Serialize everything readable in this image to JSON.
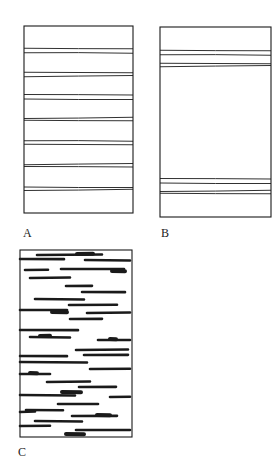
{
  "colors": {
    "ink": "#1a1a1a",
    "background": "#ffffff"
  },
  "panels": [
    {
      "id": "A",
      "label": "A",
      "description": "rectangle with seven evenly spaced pairs of thin horizontal lines",
      "rect": {
        "x": 24,
        "y": 26,
        "w": 109,
        "h": 187
      },
      "label_pos": {
        "x": 23,
        "y": 227
      },
      "lines_y": [
        49,
        53,
        72,
        76,
        95,
        99,
        118,
        121,
        141,
        144,
        164,
        167,
        187,
        190
      ]
    },
    {
      "id": "B",
      "label": "B",
      "description": "rectangle with two groups of four thin horizontal lines near top and bottom",
      "rect": {
        "x": 160,
        "y": 27,
        "w": 111,
        "h": 190
      },
      "label_pos": {
        "x": 161,
        "y": 227
      },
      "lines_y": [
        51,
        55,
        63,
        66,
        179,
        183,
        191,
        194
      ]
    },
    {
      "id": "C",
      "label": "C",
      "description": "rectangle filled with scattered thick horizontal dashes of varying length",
      "rect": {
        "x": 20,
        "y": 250,
        "w": 112,
        "h": 187
      },
      "label_pos": {
        "x": 18,
        "y": 446
      },
      "dashes": [
        {
          "y": 255,
          "x1": 37,
          "x2": 102
        },
        {
          "y": 254,
          "x1": 77,
          "x2": 93,
          "thick": true
        },
        {
          "y": 259,
          "x1": 20,
          "x2": 64
        },
        {
          "y": 260,
          "x1": 85,
          "x2": 130
        },
        {
          "y": 270,
          "x1": 25,
          "x2": 48
        },
        {
          "y": 269,
          "x1": 61,
          "x2": 124
        },
        {
          "y": 271,
          "x1": 112,
          "x2": 125,
          "thick": true
        },
        {
          "y": 278,
          "x1": 30,
          "x2": 70
        },
        {
          "y": 286,
          "x1": 66,
          "x2": 92
        },
        {
          "y": 292,
          "x1": 82,
          "x2": 125
        },
        {
          "y": 299,
          "x1": 35,
          "x2": 84
        },
        {
          "y": 305,
          "x1": 69,
          "x2": 117
        },
        {
          "y": 310,
          "x1": 20,
          "x2": 67
        },
        {
          "y": 312,
          "x1": 52,
          "x2": 67,
          "thick": true
        },
        {
          "y": 313,
          "x1": 87,
          "x2": 130
        },
        {
          "y": 319,
          "x1": 70,
          "x2": 102
        },
        {
          "y": 330,
          "x1": 20,
          "x2": 78
        },
        {
          "y": 337,
          "x1": 30,
          "x2": 70
        },
        {
          "y": 336,
          "x1": 40,
          "x2": 50,
          "thick": true
        },
        {
          "y": 340,
          "x1": 98,
          "x2": 130
        },
        {
          "y": 339,
          "x1": 110,
          "x2": 116,
          "thick": true
        },
        {
          "y": 350,
          "x1": 76,
          "x2": 128
        },
        {
          "y": 355,
          "x1": 84,
          "x2": 128
        },
        {
          "y": 356,
          "x1": 20,
          "x2": 67
        },
        {
          "y": 362,
          "x1": 20,
          "x2": 87
        },
        {
          "y": 369,
          "x1": 90,
          "x2": 130
        },
        {
          "y": 374,
          "x1": 20,
          "x2": 50
        },
        {
          "y": 373,
          "x1": 30,
          "x2": 37,
          "thick": true
        },
        {
          "y": 382,
          "x1": 47,
          "x2": 90
        },
        {
          "y": 387,
          "x1": 79,
          "x2": 116
        },
        {
          "y": 392,
          "x1": 62,
          "x2": 81,
          "thick": true
        },
        {
          "y": 395,
          "x1": 20,
          "x2": 75
        },
        {
          "y": 397,
          "x1": 110,
          "x2": 130
        },
        {
          "y": 404,
          "x1": 58,
          "x2": 98
        },
        {
          "y": 410,
          "x1": 26,
          "x2": 63
        },
        {
          "y": 412,
          "x1": 20,
          "x2": 35
        },
        {
          "y": 416,
          "x1": 72,
          "x2": 117
        },
        {
          "y": 415,
          "x1": 97,
          "x2": 110,
          "thick": true
        },
        {
          "y": 421,
          "x1": 35,
          "x2": 82
        },
        {
          "y": 426,
          "x1": 20,
          "x2": 50
        },
        {
          "y": 430,
          "x1": 76,
          "x2": 130
        },
        {
          "y": 434,
          "x1": 66,
          "x2": 84,
          "thick": true
        }
      ]
    }
  ]
}
